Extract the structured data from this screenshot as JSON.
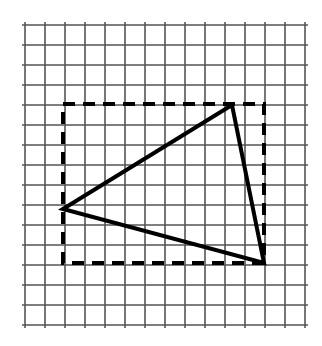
{
  "figure": {
    "type": "geometry-diagram",
    "canvas": {
      "width": 322,
      "height": 346,
      "background": "#ffffff"
    }
  },
  "chart_data": {
    "type": "scatter",
    "xlabel": "",
    "ylabel": "",
    "grid": true,
    "legend": null,
    "xlim": [
      25,
      305
    ],
    "ylim": [
      25,
      325
    ],
    "grid_spec": {
      "cell_size_px": 20,
      "vertical_lines_x": [
        25,
        45,
        65,
        85,
        105,
        125,
        145,
        165,
        185,
        205,
        225,
        245,
        265,
        285,
        305
      ],
      "horizontal_lines_y": [
        25,
        45,
        65,
        85,
        105,
        125,
        145,
        165,
        185,
        205,
        225,
        245,
        265,
        285,
        305,
        325
      ],
      "columns": 14,
      "rows": 15,
      "color": "#555555",
      "stroke_width": 1.6
    },
    "shapes": [
      {
        "name": "bounding-rectangle",
        "kind": "rect",
        "style": "dashed",
        "color": "#000000",
        "stroke_width": 4,
        "dash_array": "12 8",
        "x": 63,
        "y": 104,
        "width": 201,
        "height": 159,
        "corners": [
          [
            63,
            104
          ],
          [
            264,
            104
          ],
          [
            264,
            263
          ],
          [
            63,
            263
          ]
        ],
        "grid_units": {
          "width": 10,
          "height": 8
        }
      },
      {
        "name": "triangle",
        "kind": "polygon",
        "style": "solid",
        "color": "#000000",
        "stroke_width": 4,
        "fill": "none",
        "vertices": [
          [
            63,
            209
          ],
          [
            232,
            105
          ],
          [
            264,
            263
          ]
        ],
        "vertex_labels": [
          "left-vertex",
          "top-vertex",
          "bottom-right-vertex"
        ]
      }
    ]
  }
}
